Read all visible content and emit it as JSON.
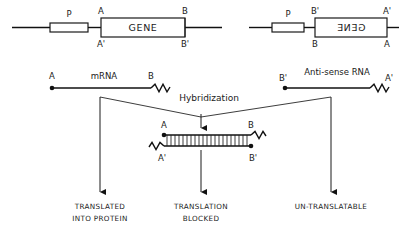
{
  "figure": {
    "background_color": "#ffffff",
    "line_color": "#1a1a1a",
    "text_color": "#1a1a1a"
  },
  "sense_construct": {
    "promoter_label": "P",
    "gene_label": "GENE",
    "label_top_left": "A",
    "label_top_right": "B",
    "label_bottom_left": "A'",
    "label_bottom_right": "B'"
  },
  "antisense_construct": {
    "promoter_label": "P",
    "gene_label": "GENE",
    "gene_label_mirrored": true,
    "label_top_left": "B'",
    "label_top_right": "A'",
    "label_bottom_left": "B",
    "label_bottom_right": "A"
  },
  "mrna": {
    "name": "mRNA",
    "label_left": "A",
    "label_right": "B"
  },
  "antisense_rna": {
    "name": "Anti-sense RNA",
    "label_left": "B'",
    "label_right": "A'"
  },
  "hybridization": {
    "label": "Hybridization",
    "duplex": {
      "label_top_left": "A",
      "label_top_right": "B",
      "label_bottom_left": "A'",
      "label_bottom_right": "B'",
      "rungs": 22
    }
  },
  "outcomes": [
    {
      "line1": "TRANSLATED",
      "line2": "INTO PROTEIN"
    },
    {
      "line1": "TRANSLATION",
      "line2": "BLOCKED"
    },
    {
      "line1": "UN-TRANSLATABLE",
      "line2": ""
    }
  ]
}
